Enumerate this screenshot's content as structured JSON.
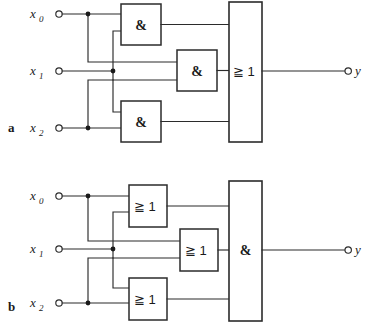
{
  "figure": {
    "background_color": "#ffffff",
    "line_color": "#2b2b2b",
    "notation": "IEC 60617 rectangular logic symbols",
    "panels": [
      {
        "id": "a",
        "label": "a",
        "inputs": [
          {
            "name": "x0",
            "base": "x",
            "subscript": "0"
          },
          {
            "name": "x1",
            "base": "x",
            "subscript": "1"
          },
          {
            "name": "x2",
            "base": "x",
            "subscript": "2"
          }
        ],
        "first_stage_gates": [
          {
            "id": "a-and-top",
            "symbol": "&",
            "function": "AND"
          },
          {
            "id": "a-and-mid",
            "symbol": "&",
            "function": "AND"
          },
          {
            "id": "a-and-bot",
            "symbol": "&",
            "function": "AND"
          }
        ],
        "output_gate": {
          "id": "a-or-out",
          "symbol": "≧ 1",
          "function": "OR"
        },
        "output": {
          "name": "y",
          "base": "y",
          "subscript": ""
        }
      },
      {
        "id": "b",
        "label": "b",
        "inputs": [
          {
            "name": "x0",
            "base": "x",
            "subscript": "0"
          },
          {
            "name": "x1",
            "base": "x",
            "subscript": "1"
          },
          {
            "name": "x2",
            "base": "x",
            "subscript": "2"
          }
        ],
        "first_stage_gates": [
          {
            "id": "b-or-top",
            "symbol": "≧ 1",
            "function": "OR"
          },
          {
            "id": "b-or-mid",
            "symbol": "≧ 1",
            "function": "OR"
          },
          {
            "id": "b-or-bot",
            "symbol": "≧ 1",
            "function": "OR"
          }
        ],
        "output_gate": {
          "id": "b-and-out",
          "symbol": "&",
          "function": "AND"
        },
        "output": {
          "name": "y",
          "base": "y",
          "subscript": ""
        }
      }
    ]
  }
}
